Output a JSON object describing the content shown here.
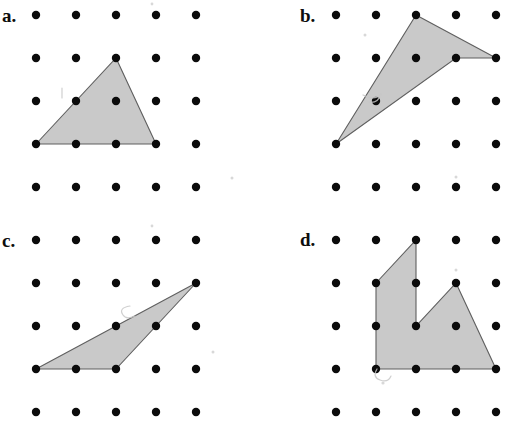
{
  "page": {
    "kind": "geoboard-worksheet",
    "background_color": "#ffffff",
    "width": 506,
    "height": 416,
    "dot_color": "#0b0b0b",
    "shape_fill_color": "#c9c9c9",
    "shape_stroke_color": "#5f5f5f",
    "label_color": "#0d0d0d"
  },
  "grid": {
    "columns": 5,
    "rows": 5,
    "dot_radius": 4.2,
    "column_spacing": 40,
    "row_spacing": 43
  },
  "panels": [
    {
      "id": "a",
      "label": "a.",
      "label_x": 2,
      "label_y": 6,
      "origin_x": 36,
      "origin_y": 15,
      "shape": {
        "name": "triangle",
        "vertices": [
          [
            1,
            4
          ],
          [
            3,
            2
          ],
          [
            4,
            4
          ]
        ]
      },
      "marks": [
        {
          "type": "stroke",
          "path": "M 62 88 L 62 98"
        },
        {
          "type": "speck",
          "cx": 152,
          "cy": 4,
          "r": 1.4
        },
        {
          "type": "speck",
          "cx": 232,
          "cy": 178,
          "r": 1.5
        }
      ]
    },
    {
      "id": "b",
      "label": "b.",
      "label_x": 300,
      "label_y": 6,
      "origin_x": 336,
      "origin_y": 15,
      "shape": {
        "name": "concave-quadrilateral",
        "vertices": [
          [
            3,
            1
          ],
          [
            5,
            2
          ],
          [
            4,
            2
          ],
          [
            1,
            4
          ]
        ]
      },
      "marks": [
        {
          "type": "stroke",
          "path": "M 363 95 q 12 6 18 -1 q -3 10 -13 8"
        },
        {
          "type": "speck",
          "cx": 365,
          "cy": 35,
          "r": 1.5
        },
        {
          "type": "speck",
          "cx": 456,
          "cy": 177,
          "r": 1.5
        }
      ]
    },
    {
      "id": "c",
      "label": "c.",
      "label_x": 2,
      "label_y": 231,
      "origin_x": 36,
      "origin_y": 240,
      "shape": {
        "name": "triangle",
        "vertices": [
          [
            5,
            2
          ],
          [
            3,
            4
          ],
          [
            1,
            4
          ]
        ]
      },
      "marks": [
        {
          "type": "stroke",
          "path": "M 130 306 q -12 2 -7 9 q 3 5 12 1"
        },
        {
          "type": "speck",
          "cx": 152,
          "cy": 226,
          "r": 1.4
        },
        {
          "type": "speck",
          "cx": 213,
          "cy": 352,
          "r": 1.5
        }
      ]
    },
    {
      "id": "d",
      "label": "d.",
      "label_x": 300,
      "label_y": 230,
      "origin_x": 336,
      "origin_y": 240,
      "shape": {
        "name": "concave-polygon",
        "vertices": [
          [
            2,
            2
          ],
          [
            3,
            1
          ],
          [
            3,
            3
          ],
          [
            4,
            2
          ],
          [
            5,
            4
          ],
          [
            2,
            4
          ]
        ]
      },
      "marks": [
        {
          "type": "stroke",
          "path": "M 377 369 q -5 8 3 11 q 8 3 11 -4"
        },
        {
          "type": "speck",
          "cx": 456,
          "cy": 270,
          "r": 1.5
        },
        {
          "type": "speck",
          "cx": 383,
          "cy": 383,
          "r": 1.6
        }
      ]
    }
  ]
}
